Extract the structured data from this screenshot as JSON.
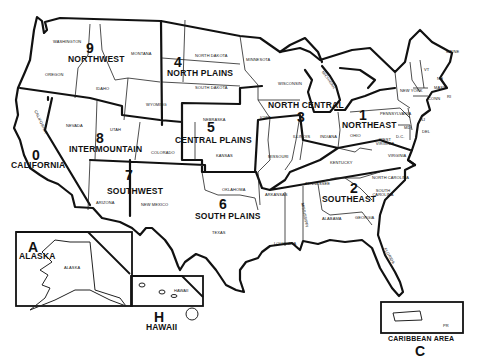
{
  "map": {
    "title": "Regional areas map of the United States",
    "regions": [
      {
        "number": "0",
        "name": "CALIFORNIA"
      },
      {
        "number": "1",
        "name": "NORTHEAST"
      },
      {
        "number": "2",
        "name": "SOUTHEAST"
      },
      {
        "number": "3",
        "name": "NORTH CENTRAL"
      },
      {
        "number": "4",
        "name": "NORTH PLAINS"
      },
      {
        "number": "5",
        "name": "CENTRAL PLAINS"
      },
      {
        "number": "6",
        "name": "SOUTH PLAINS"
      },
      {
        "number": "7",
        "name": "SOUTHWEST"
      },
      {
        "number": "8",
        "name": "INTERMOUNTAIN"
      },
      {
        "number": "9",
        "name": "NORTHWEST"
      },
      {
        "number": "A",
        "name": "ALASKA"
      },
      {
        "number": "H",
        "name": "HAWAII"
      },
      {
        "number": "C",
        "name": "CARIBBEAN AREA"
      }
    ],
    "states": {
      "washington": "WASHINGTON",
      "oregon": "OREGON",
      "idaho": "IDAHO",
      "montana": "MONTANA",
      "wyoming": "WYOMING",
      "california": "CALIFORNIA",
      "nevada": "NEVADA",
      "utah": "UTAH",
      "colorado": "COLORADO",
      "arizona": "ARIZONA",
      "new_mexico": "NEW MEXICO",
      "north_dakota": "NORTH DAKOTA",
      "south_dakota": "SOUTH DAKOTA",
      "nebraska": "NEBRASKA",
      "kansas": "KANSAS",
      "oklahoma": "OKLAHOMA",
      "texas": "TEXAS",
      "minnesota": "MINNESOTA",
      "wisconsin": "WISCONSIN",
      "michigan": "MICHIGAN",
      "iowa": "IOWA",
      "illinois": "ILLINOIS",
      "indiana": "INDIANA",
      "missouri": "MISSOURI",
      "ohio": "OHIO",
      "kentucky": "KENTUCKY",
      "west_virginia": "WEST VIRGINIA",
      "virginia": "VIRGINIA",
      "pennsylvania": "PENNSYLVANIA",
      "new_york": "NEW YORK",
      "maine": "MAINE",
      "vermont": "VT",
      "new_hampshire": "NH",
      "massachusetts": "MASS",
      "connecticut": "CONN",
      "rhode_island": "RI",
      "new_jersey": "NJ",
      "maryland": "MD",
      "delaware": "DEL",
      "dc": "D.C.",
      "arkansas": "ARKANSAS",
      "louisiana": "LOUISIANA",
      "mississippi": "MISSISSIPPI",
      "tennessee": "TENNESSEE",
      "alabama": "ALABAMA",
      "georgia": "GEORGIA",
      "florida": "FLORIDA",
      "north_carolina": "NORTH CAROLINA",
      "south_carolina": "SOUTH CAROLINA",
      "alaska": "ALASKA",
      "hawaii": "HAWAII",
      "pr": "PR"
    }
  }
}
